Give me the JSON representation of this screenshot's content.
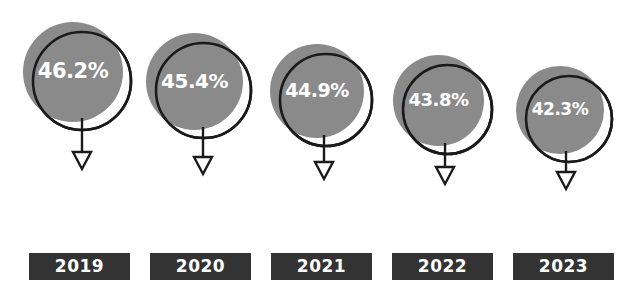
{
  "chart_data": {
    "type": "bar",
    "title": "",
    "subtitle": "",
    "xlabel": "",
    "ylabel": "",
    "categories": [
      "2019",
      "2020",
      "2021",
      "2022",
      "2023"
    ],
    "values": [
      46.2,
      45.4,
      44.9,
      43.8,
      42.3
    ],
    "value_labels": [
      "46.2%",
      "45.4%",
      "44.9%",
      "43.8%",
      "42.3%"
    ],
    "unit": "%",
    "ylim": [
      0,
      50
    ],
    "grid": false,
    "legend": null,
    "annotations": [],
    "series": [
      {
        "name": "",
        "values": [
          46.2,
          45.4,
          44.9,
          43.8,
          42.3
        ]
      }
    ]
  },
  "style": {
    "bubble_fill": "#8a8a8a",
    "bubble_outline": "#1a1a1a",
    "label_box_fill": "#333333",
    "label_text_color": "#ffffff",
    "value_text_color": "#ffffff",
    "background": "#ffffff"
  },
  "bubbles": [
    {
      "value_label": "46.2%",
      "year": "2019",
      "left": 23,
      "top": 22,
      "size": 100,
      "font_size": 21,
      "ring_offset": 9,
      "arrow_x": 82,
      "arrow_top": 118,
      "arrow_len": 47
    },
    {
      "value_label": "45.4%",
      "year": "2020",
      "left": 146,
      "top": 33,
      "size": 97,
      "font_size": 20,
      "ring_offset": 9,
      "arrow_x": 203,
      "arrow_top": 127,
      "arrow_len": 43
    },
    {
      "value_label": "44.9%",
      "year": "2021",
      "left": 270,
      "top": 44,
      "size": 94,
      "font_size": 19,
      "ring_offset": 9,
      "arrow_x": 324,
      "arrow_top": 135,
      "arrow_len": 40
    },
    {
      "value_label": "43.8%",
      "year": "2022",
      "left": 393,
      "top": 55,
      "size": 91,
      "font_size": 18,
      "ring_offset": 9,
      "arrow_x": 445,
      "arrow_top": 143,
      "arrow_len": 37
    },
    {
      "value_label": "42.3%",
      "year": "2023",
      "left": 516,
      "top": 66,
      "size": 88,
      "font_size": 17,
      "ring_offset": 9,
      "arrow_x": 566,
      "arrow_top": 151,
      "arrow_len": 34
    }
  ],
  "year_boxes": [
    {
      "label": "2019",
      "left": 29,
      "top": 253,
      "width": 101,
      "height": 27
    },
    {
      "label": "2020",
      "left": 150,
      "top": 253,
      "width": 101,
      "height": 27
    },
    {
      "label": "2021",
      "left": 271,
      "top": 253,
      "width": 101,
      "height": 27
    },
    {
      "label": "2022",
      "left": 392,
      "top": 253,
      "width": 101,
      "height": 27
    },
    {
      "label": "2023",
      "left": 513,
      "top": 253,
      "width": 101,
      "height": 27
    }
  ]
}
